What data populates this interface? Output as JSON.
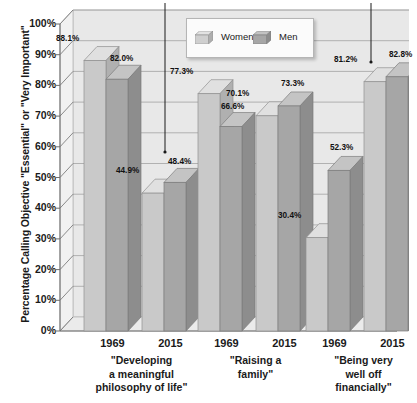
{
  "chart_data": {
    "type": "bar",
    "title": "",
    "xlabel": "",
    "ylabel": "Percentage Calling Objective \"Essential\" or \"Very Important\"",
    "ylim": [
      0,
      100
    ],
    "y_tick_labels": [
      "100%",
      "90%",
      "80%",
      "70%",
      "60%",
      "50%",
      "40%",
      "30%",
      "20%",
      "10%",
      "0%"
    ],
    "y_tick_values": [
      100,
      90,
      80,
      70,
      60,
      50,
      40,
      30,
      20,
      10,
      0
    ],
    "grid": true,
    "legend_position": "top-center",
    "categories": [
      "1969",
      "2015",
      "1969",
      "2015",
      "1969",
      "2015"
    ],
    "groups": [
      {
        "caption": "\"Developing a meaningful philosophy of life\"",
        "caption_lines": [
          "\"Developing",
          "a meaningful",
          "philosophy of life\""
        ],
        "years": [
          {
            "year": "1969",
            "bars": [
              {
                "series": "Women",
                "value": 88.1,
                "label": "88.1%"
              },
              {
                "series": "Men",
                "value": 82.0,
                "label": "82.0%"
              }
            ]
          },
          {
            "year": "2015",
            "bars": [
              {
                "series": "Women",
                "value": 44.9,
                "label": "44.9%"
              },
              {
                "series": "Men",
                "value": 48.4,
                "label": "48.4%"
              }
            ]
          }
        ]
      },
      {
        "caption": "\"Raising a family\"",
        "caption_lines": [
          "\"Raising a",
          "family\""
        ],
        "years": [
          {
            "year": "1969",
            "bars": [
              {
                "series": "Women",
                "value": 77.3,
                "label": "77.3%"
              },
              {
                "series": "Men",
                "value": 66.6,
                "label": "66.6%"
              }
            ]
          },
          {
            "year": "2015",
            "bars": [
              {
                "series": "Women",
                "value": 70.1,
                "label": "70.1%"
              },
              {
                "series": "Men",
                "value": 73.3,
                "label": "73.3%"
              }
            ]
          }
        ]
      },
      {
        "caption": "\"Being very well off financially\"",
        "caption_lines": [
          "\"Being very",
          "well off",
          "financially\""
        ],
        "years": [
          {
            "year": "1969",
            "bars": [
              {
                "series": "Women",
                "value": 30.4,
                "label": "30.4%"
              },
              {
                "series": "Men",
                "value": 52.3,
                "label": "52.3%"
              }
            ]
          },
          {
            "year": "2015",
            "bars": [
              {
                "series": "Women",
                "value": 81.2,
                "label": "81.2%"
              },
              {
                "series": "Men",
                "value": 82.8,
                "label": "82.8%"
              }
            ]
          }
        ]
      }
    ],
    "series": [
      {
        "name": "Women",
        "values": [
          88.1,
          44.9,
          77.3,
          70.1,
          30.4,
          81.2
        ],
        "color": "#c9c9c9"
      },
      {
        "name": "Men",
        "values": [
          82.0,
          48.4,
          66.6,
          73.3,
          52.3,
          82.8
        ],
        "color": "#a6a6a6"
      }
    ],
    "annotations": [
      {
        "target_label": "48.4%",
        "kind": "arrow-down"
      },
      {
        "target_label": "82.8%",
        "kind": "arrow-down"
      }
    ]
  },
  "legend": {
    "women_label": "Women",
    "men_label": "Men"
  },
  "colors": {
    "women_front": "#c9c9c9",
    "women_top": "#e0e0e0",
    "women_side": "#b0b0b0",
    "men_front": "#a6a6a6",
    "men_top": "#c4c4c4",
    "men_side": "#8d8d8d",
    "wall": "#e8e8e8",
    "floor": "#ebebeb",
    "grid": "#9a9a9a",
    "axis": "#6f6f6f",
    "text": "#1a1a1a"
  }
}
